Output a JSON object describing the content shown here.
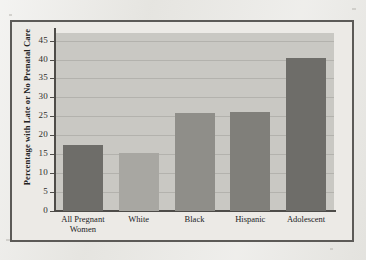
{
  "figure": {
    "background_color": "#e6e5e1",
    "frame_color": "#5c5a57",
    "plot_background_color": "#c9c8c3",
    "gridline_color": "#b3b2ad",
    "axis_color": "#4e4c49"
  },
  "chart_data": {
    "type": "bar",
    "title": "",
    "xlabel": "",
    "ylabel": "Percentage with Late or No Prenatal Care",
    "categories": [
      "All Pregnant Women",
      "White",
      "Black",
      "Hispanic",
      "Adolescent"
    ],
    "category_lines": [
      [
        "All Pregnant",
        "Women"
      ],
      [
        "White"
      ],
      [
        "Black"
      ],
      [
        "Hispanic"
      ],
      [
        "Adolescent"
      ]
    ],
    "values": [
      17.5,
      15.2,
      26.0,
      26.2,
      40.4
    ],
    "bar_colors": [
      "#6e6d69",
      "#a8a7a2",
      "#8f8e89",
      "#807f7a",
      "#6e6d69"
    ],
    "ylim": [
      0,
      47
    ],
    "yticks": [
      0,
      5,
      10,
      15,
      20,
      25,
      30,
      35,
      40,
      45
    ],
    "ytick_labels": [
      "0",
      "5",
      "10",
      "15",
      "20",
      "25",
      "30",
      "35",
      "40",
      "45"
    ],
    "grid": true,
    "grid_axis": "y",
    "legend": false,
    "legend_position": "none"
  }
}
